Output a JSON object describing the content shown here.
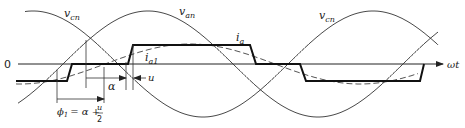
{
  "diagram": {
    "type": "waveform",
    "axis": {
      "origin_label": "0",
      "x_label": "ωt"
    },
    "curves": {
      "v_cn_left_label": "v_cn",
      "v_cn_left_label_main": "v",
      "v_cn_left_label_sub": "cn",
      "v_an_label_main": "v",
      "v_an_label_sub": "an",
      "v_cn_right_label_main": "v",
      "v_cn_right_label_sub": "cn",
      "i_a_label_main": "i",
      "i_a_label_sub": "a",
      "i_a1_label_main": "i",
      "i_a1_label_sub": "a1"
    },
    "annotations": {
      "alpha_label": "α",
      "u_label": "u",
      "phi_formula_lhs_main": "ϕ",
      "phi_formula_lhs_sub": "1",
      "phi_formula_eq": "= α +",
      "phi_formula_num": "u",
      "phi_formula_den": "2"
    },
    "colors": {
      "line": "#222222",
      "thin_line": "#333333",
      "dashed": "#555555"
    },
    "geometry": {
      "zero_y": 64,
      "sine_amplitude_px": 53,
      "period_px": 340,
      "v_cn_peak_x": 33,
      "v_an_peak_x": 148,
      "i_a_high_y": 45,
      "i_a_low_y": 81,
      "i_a1_amplitude_px": 20,
      "i_a1_peak_x": 190
    }
  }
}
